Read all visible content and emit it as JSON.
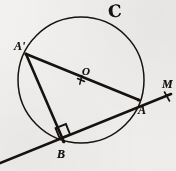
{
  "figure": {
    "caption_letters": {
      "circle": "C",
      "point_a_prime": "A'",
      "center": "O",
      "ray_end": "M",
      "point_a": "A",
      "point_b": "B"
    },
    "colors": {
      "ink": "#16120f",
      "paper": "#f2f1ef"
    },
    "geometry": {
      "circle": {
        "cx": 81,
        "cy": 80,
        "r": 63
      },
      "points": {
        "A_prime": {
          "x": 26,
          "y": 54
        },
        "O": {
          "x": 81,
          "y": 80
        },
        "A": {
          "x": 138,
          "y": 100
        },
        "B": {
          "x": 63,
          "y": 141
        },
        "M": {
          "x": 171,
          "y": 94
        }
      },
      "segments": [
        {
          "name": "diameter-a-prime-to-a",
          "from": "A_prime",
          "to": "A"
        },
        {
          "name": "chord-a-prime-to-b",
          "from": "A_prime",
          "to": "B"
        },
        {
          "name": "secant-through-b-and-a-to-m",
          "from": "B",
          "to": "M"
        }
      ],
      "right_angle_at": "B",
      "center_tick": true,
      "ray_tick_near": "M"
    }
  }
}
